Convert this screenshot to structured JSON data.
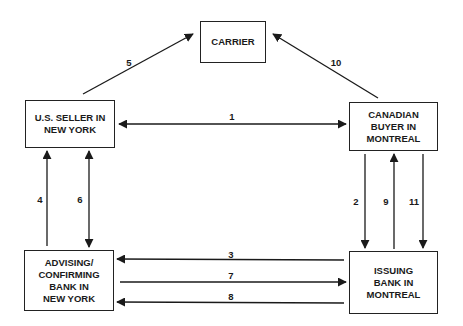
{
  "nodes": {
    "carrier": "CARRIER",
    "seller": "U.S. SELLER IN\nNEW YORK",
    "buyer": "CANADIAN\nBUYER IN\nMONTREAL",
    "advising_bank": "ADVISING/\nCONFIRMING\nBANK IN\nNEW YORK",
    "issuing_bank": "ISSUING\nBANK IN\nMONTREAL"
  },
  "edges": [
    {
      "label": "1",
      "from": "U.S. SELLER IN NEW YORK",
      "to": "CANADIAN BUYER IN MONTREAL",
      "direction": "both"
    },
    {
      "label": "2",
      "from": "CANADIAN BUYER IN MONTREAL",
      "to": "ISSUING BANK IN MONTREAL"
    },
    {
      "label": "3",
      "from": "ISSUING BANK IN MONTREAL",
      "to": "ADVISING/CONFIRMING BANK IN NEW YORK"
    },
    {
      "label": "4",
      "from": "ADVISING/CONFIRMING BANK IN NEW YORK",
      "to": "U.S. SELLER IN NEW YORK"
    },
    {
      "label": "5",
      "from": "U.S. SELLER IN NEW YORK",
      "to": "CARRIER"
    },
    {
      "label": "6",
      "from": "U.S. SELLER IN NEW YORK",
      "to": "ADVISING/CONFIRMING BANK IN NEW YORK",
      "direction": "both"
    },
    {
      "label": "7",
      "from": "ADVISING/CONFIRMING BANK IN NEW YORK",
      "to": "ISSUING BANK IN MONTREAL"
    },
    {
      "label": "8",
      "from": "ISSUING BANK IN MONTREAL",
      "to": "ADVISING/CONFIRMING BANK IN NEW YORK"
    },
    {
      "label": "9",
      "from": "ISSUING BANK IN MONTREAL",
      "to": "CANADIAN BUYER IN MONTREAL"
    },
    {
      "label": "10",
      "from": "CANADIAN BUYER IN MONTREAL",
      "to": "CARRIER"
    },
    {
      "label": "11",
      "from": "CANADIAN BUYER IN MONTREAL",
      "to": "ISSUING BANK IN MONTREAL"
    }
  ],
  "labels": {
    "e1": "1",
    "e2": "2",
    "e3": "3",
    "e4": "4",
    "e5": "5",
    "e6": "6",
    "e7": "7",
    "e8": "8",
    "e9": "9",
    "e10": "10",
    "e11": "11"
  },
  "colors": {
    "line": "#1a1a1a",
    "background": "#ffffff"
  }
}
